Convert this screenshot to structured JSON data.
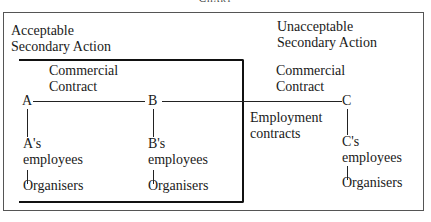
{
  "title": "Chart",
  "sections": {
    "acceptable": {
      "line1": "Acceptable",
      "line2": "Secondary Action"
    },
    "unacceptable": {
      "line1": "Unacceptable",
      "line2": "Secondary Action"
    }
  },
  "labels": {
    "commercial_contract_ab": {
      "line1": "Commercial",
      "line2": "Contract"
    },
    "commercial_contract_bc": {
      "line1": "Commercial",
      "line2": "Contract"
    },
    "employment_contracts": {
      "line1": "Employment",
      "line2": "contracts"
    }
  },
  "nodes": [
    {
      "id": "A",
      "label": "A",
      "employees": "A's",
      "employees2": "employees",
      "organisers": "Organisers"
    },
    {
      "id": "B",
      "label": "B",
      "employees": "B's",
      "employees2": "employees",
      "organisers": "Organisers"
    },
    {
      "id": "C",
      "label": "C",
      "employees": "C's",
      "employees2": "employees",
      "organisers": "Organisers"
    }
  ]
}
